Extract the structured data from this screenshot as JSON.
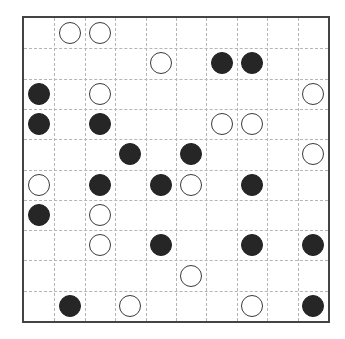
{
  "puzzle": {
    "type": "masyu",
    "rows": 10,
    "cols": 10,
    "colors": {
      "border": "#444444",
      "grid_line": "#b5b5b5",
      "black_pearl": "#262626",
      "white_pearl_fill": "#ffffff",
      "white_pearl_stroke": "#3a3a3a"
    },
    "grid": [
      ".WW.......",
      "....W.BB..",
      "B.W......W",
      "B.B...WW..",
      "...B.B...W",
      "W.B.BW.B..",
      "B.W.......",
      "..W.B..B.B",
      ".....W....",
      ".B.W...W.B"
    ]
  }
}
